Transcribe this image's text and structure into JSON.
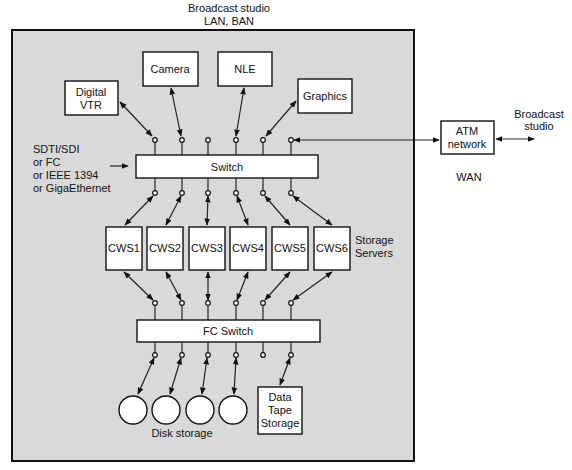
{
  "diagram": {
    "top_label": [
      "Broadcast studio",
      "LAN, BAN"
    ],
    "colors": {
      "background": "#ffffff",
      "studio_area": "#d9d9d9",
      "box_fill": "#ffffff",
      "stroke": "#111111"
    },
    "sources": [
      {
        "id": "digital-vtr",
        "label": [
          "Digital",
          "VTR"
        ]
      },
      {
        "id": "camera",
        "label": [
          "Camera"
        ]
      },
      {
        "id": "nle",
        "label": [
          "NLE"
        ]
      },
      {
        "id": "graphics",
        "label": [
          "Graphics"
        ]
      }
    ],
    "interconnect_note": [
      "SDTI/SDI",
      "or FC",
      "or IEEE 1394",
      "or GigaEthernet"
    ],
    "switch": {
      "label": "Switch"
    },
    "servers": {
      "items": [
        "CWS1",
        "CWS2",
        "CWS3",
        "CWS4",
        "CWS5",
        "CWS6"
      ],
      "group_label": [
        "Storage",
        "Servers"
      ]
    },
    "fc_switch": {
      "label": "FC Switch"
    },
    "storage": {
      "disk_count": 4,
      "disk_label": "Disk storage",
      "tape_label": [
        "Data",
        "Tape",
        "Storage"
      ]
    },
    "wan": {
      "atm_label": [
        "ATM",
        "network"
      ],
      "remote_label": [
        "Broadcast",
        "studio"
      ],
      "wan_label": "WAN"
    }
  }
}
